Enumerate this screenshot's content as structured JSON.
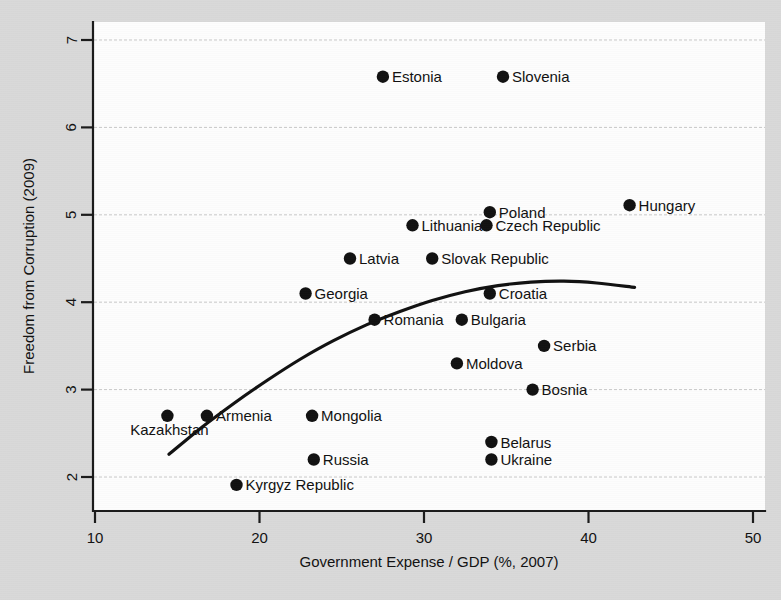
{
  "figure": {
    "background_color": "#d9d9d9",
    "plot_background_color": "#fdfdfd",
    "marker_color": "#111111",
    "curve_color": "#111111",
    "grid_color": "#c9c9c9"
  },
  "chart_data": {
    "type": "scatter",
    "title": "",
    "xlabel": "Government Expense / GDP (%, 2007)",
    "ylabel": "Freedom from Corruption (2009)",
    "xlim": [
      8.5,
      51.0
    ],
    "ylim": [
      1.6,
      7.25
    ],
    "xticks": [
      10,
      20,
      30,
      40,
      50
    ],
    "yticks": [
      2,
      3,
      4,
      5,
      6,
      7
    ],
    "xtick_labels": [
      "10",
      "20",
      "30",
      "40",
      "50"
    ],
    "ytick_labels": [
      "2",
      "3",
      "4",
      "5",
      "6",
      "7"
    ],
    "grid": "horizontal",
    "legend": "none",
    "points": [
      {
        "label": "Estonia",
        "x": 27.5,
        "y": 6.58,
        "label_side": "right"
      },
      {
        "label": "Slovenia",
        "x": 34.8,
        "y": 6.58,
        "label_side": "right"
      },
      {
        "label": "Hungary",
        "x": 42.5,
        "y": 5.11,
        "label_side": "right"
      },
      {
        "label": "Poland",
        "x": 34.0,
        "y": 5.03,
        "label_side": "right"
      },
      {
        "label": "Czech Republic",
        "x": 33.8,
        "y": 4.88,
        "label_side": "right"
      },
      {
        "label": "Lithuania",
        "x": 29.3,
        "y": 4.88,
        "label_side": "right"
      },
      {
        "label": "Latvia",
        "x": 25.5,
        "y": 4.5,
        "label_side": "right"
      },
      {
        "label": "Slovak Republic",
        "x": 30.5,
        "y": 4.5,
        "label_side": "right"
      },
      {
        "label": "Georgia",
        "x": 22.8,
        "y": 4.1,
        "label_side": "right"
      },
      {
        "label": "Croatia",
        "x": 34.0,
        "y": 4.1,
        "label_side": "right"
      },
      {
        "label": "Romania",
        "x": 27.0,
        "y": 3.8,
        "label_side": "right"
      },
      {
        "label": "Bulgaria",
        "x": 32.3,
        "y": 3.8,
        "label_side": "right"
      },
      {
        "label": "Serbia",
        "x": 37.3,
        "y": 3.5,
        "label_side": "right"
      },
      {
        "label": "Moldova",
        "x": 32.0,
        "y": 3.3,
        "label_side": "right"
      },
      {
        "label": "Bosnia",
        "x": 36.6,
        "y": 3.0,
        "label_side": "right"
      },
      {
        "label": "Armenia",
        "x": 16.8,
        "y": 2.7,
        "label_side": "right"
      },
      {
        "label": "Kazakhstan",
        "x": 14.4,
        "y": 2.7,
        "label_side": "below"
      },
      {
        "label": "Mongolia",
        "x": 23.2,
        "y": 2.7,
        "label_side": "right"
      },
      {
        "label": "Belarus",
        "x": 34.1,
        "y": 2.4,
        "label_side": "right"
      },
      {
        "label": "Russia",
        "x": 23.3,
        "y": 2.2,
        "label_side": "right"
      },
      {
        "label": "Ukraine",
        "x": 34.1,
        "y": 2.2,
        "label_side": "right"
      },
      {
        "label": "Kyrgyz Republic",
        "x": 18.6,
        "y": 1.91,
        "label_side": "right"
      }
    ],
    "fit_curve": {
      "name": "quadratic-fit",
      "x_start": 14.5,
      "x_end": 42.8,
      "points": [
        {
          "x": 14.5,
          "y": 2.26
        },
        {
          "x": 16.5,
          "y": 2.57
        },
        {
          "x": 18.5,
          "y": 2.85
        },
        {
          "x": 20.5,
          "y": 3.11
        },
        {
          "x": 22.5,
          "y": 3.35
        },
        {
          "x": 24.5,
          "y": 3.56
        },
        {
          "x": 26.5,
          "y": 3.74
        },
        {
          "x": 28.5,
          "y": 3.89
        },
        {
          "x": 30.5,
          "y": 4.02
        },
        {
          "x": 32.5,
          "y": 4.12
        },
        {
          "x": 34.5,
          "y": 4.19
        },
        {
          "x": 36.5,
          "y": 4.23
        },
        {
          "x": 38.5,
          "y": 4.24
        },
        {
          "x": 40.5,
          "y": 4.22
        },
        {
          "x": 42.8,
          "y": 4.17
        }
      ]
    }
  }
}
